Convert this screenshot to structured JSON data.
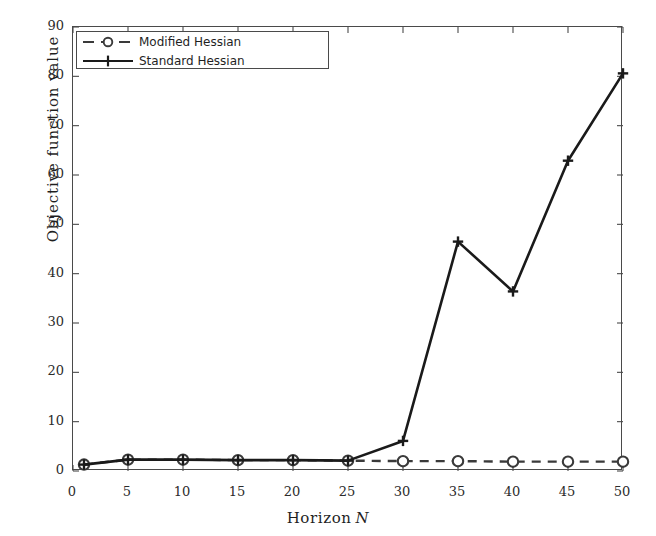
{
  "chart_data": {
    "type": "line",
    "title": "",
    "subtitle": "",
    "xlabel_prefix": "Horizon",
    "xlabel_symbol": "N",
    "xlabel": "Horizon N",
    "ylabel": "Objective function value",
    "xlim": [
      0,
      50
    ],
    "ylim": [
      0,
      90
    ],
    "xticks": [
      0,
      5,
      10,
      15,
      20,
      25,
      30,
      35,
      40,
      45,
      50
    ],
    "xtick_labels": [
      "0",
      "5",
      "10",
      "15",
      "20",
      "25",
      "30",
      "35",
      "40",
      "45",
      "50"
    ],
    "yticks": [
      0,
      10,
      20,
      30,
      40,
      50,
      60,
      70,
      80,
      90
    ],
    "ytick_labels": [
      "0",
      "10",
      "20",
      "30",
      "40",
      "50",
      "60",
      "70",
      "80",
      "90"
    ],
    "grid": false,
    "legend_position": "top-left",
    "x": [
      1,
      5,
      10,
      15,
      20,
      25,
      30,
      35,
      40,
      45,
      50
    ],
    "series": [
      {
        "name": "Modified Hessian",
        "marker": "circle",
        "linestyle": "dashed",
        "color": "#3a3a3a",
        "values": [
          1.3,
          2.3,
          2.3,
          2.2,
          2.2,
          2.1,
          2.0,
          2.0,
          1.9,
          1.9,
          1.9
        ]
      },
      {
        "name": "Standard Hessian",
        "marker": "plus",
        "linestyle": "solid",
        "color": "#1a1a1a",
        "values": [
          1.3,
          2.3,
          2.3,
          2.2,
          2.2,
          2.1,
          6.1,
          46.5,
          36.4,
          62.9,
          80.6
        ]
      }
    ]
  },
  "legend": {
    "items": [
      {
        "label": "Modified Hessian",
        "marker": "circle-marker",
        "linestyle": "dashed"
      },
      {
        "label": "Standard Hessian",
        "marker": "plus-marker",
        "linestyle": "solid"
      }
    ]
  },
  "colors": {
    "axis": "#4a4a4a",
    "modified_hessian": "#3a3a3a",
    "standard_hessian": "#1a1a1a",
    "background": "#ffffff",
    "text": "#1f1f1f"
  }
}
